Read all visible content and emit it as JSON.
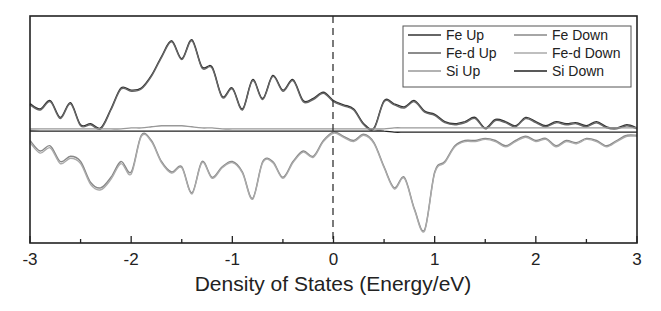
{
  "chart_data": {
    "type": "line",
    "title": "",
    "xlabel": "Density of States (Energy/eV)",
    "ylabel": "",
    "xlim": [
      -3,
      3
    ],
    "x_ticks": [
      "-3",
      "-2",
      "-1",
      "0",
      "1",
      "2",
      "3"
    ],
    "grid": false,
    "fermi_level_line": {
      "x": 0,
      "style": "dashed"
    },
    "legend": {
      "position": "upper right",
      "entries": [
        "Fe Up",
        "Fe Down",
        "Fe-d Up",
        "Fe-d Down",
        "Si Up",
        "Si Down"
      ]
    },
    "x": [
      -3.0,
      -2.9,
      -2.8,
      -2.7,
      -2.6,
      -2.5,
      -2.4,
      -2.3,
      -2.2,
      -2.1,
      -2.0,
      -1.9,
      -1.8,
      -1.7,
      -1.6,
      -1.5,
      -1.4,
      -1.3,
      -1.2,
      -1.1,
      -1.0,
      -0.9,
      -0.8,
      -0.7,
      -0.6,
      -0.5,
      -0.4,
      -0.3,
      -0.2,
      -0.1,
      0.0,
      0.1,
      0.2,
      0.3,
      0.4,
      0.5,
      0.6,
      0.7,
      0.8,
      0.9,
      1.0,
      1.1,
      1.2,
      1.3,
      1.4,
      1.5,
      1.6,
      1.7,
      1.8,
      1.9,
      2.0,
      2.1,
      2.2,
      2.3,
      2.4,
      2.5,
      2.6,
      2.7,
      2.8,
      2.9,
      3.0
    ],
    "series": [
      {
        "name": "Fe Up",
        "values": [
          0.25,
          0.2,
          0.28,
          0.12,
          0.26,
          0.05,
          0.06,
          0.02,
          0.2,
          0.4,
          0.38,
          0.4,
          0.52,
          0.7,
          0.85,
          0.68,
          0.86,
          0.6,
          0.6,
          0.32,
          0.4,
          0.2,
          0.48,
          0.3,
          0.52,
          0.38,
          0.48,
          0.28,
          0.3,
          0.36,
          0.28,
          0.24,
          0.2,
          0.06,
          0.02,
          0.28,
          0.25,
          0.22,
          0.28,
          0.18,
          0.15,
          0.08,
          0.06,
          0.08,
          0.12,
          0.02,
          0.1,
          0.08,
          0.04,
          0.12,
          0.08,
          0.04,
          0.08,
          0.06,
          0.07,
          0.04,
          0.08,
          0.03,
          0.02,
          0.05,
          0.02
        ]
      },
      {
        "name": "Fe Down",
        "values": [
          -0.1,
          -0.2,
          -0.15,
          -0.3,
          -0.25,
          -0.3,
          -0.5,
          -0.55,
          -0.45,
          -0.3,
          -0.4,
          -0.05,
          -0.1,
          -0.3,
          -0.4,
          -0.35,
          -0.6,
          -0.3,
          -0.45,
          -0.35,
          -0.3,
          -0.4,
          -0.65,
          -0.3,
          -0.3,
          -0.45,
          -0.3,
          -0.2,
          -0.25,
          -0.1,
          -0.02,
          -0.06,
          -0.1,
          -0.04,
          -0.12,
          -0.35,
          -0.55,
          -0.45,
          -0.75,
          -0.95,
          -0.4,
          -0.3,
          -0.15,
          -0.1,
          -0.1,
          -0.08,
          -0.1,
          -0.15,
          -0.1,
          -0.06,
          -0.1,
          -0.08,
          -0.15,
          -0.1,
          -0.12,
          -0.08,
          -0.1,
          -0.15,
          -0.1,
          -0.05,
          -0.05
        ]
      },
      {
        "name": "Fe-d Up",
        "values": [
          0.24,
          0.19,
          0.27,
          0.11,
          0.25,
          0.04,
          0.05,
          0.01,
          0.19,
          0.39,
          0.37,
          0.39,
          0.51,
          0.69,
          0.84,
          0.67,
          0.85,
          0.59,
          0.59,
          0.31,
          0.39,
          0.19,
          0.47,
          0.29,
          0.51,
          0.37,
          0.47,
          0.27,
          0.29,
          0.35,
          0.27,
          0.23,
          0.19,
          0.05,
          0.01,
          0.27,
          0.24,
          0.21,
          0.27,
          0.17,
          0.14,
          0.07,
          0.05,
          0.07,
          0.11,
          0.01,
          0.09,
          0.07,
          0.03,
          0.11,
          0.07,
          0.03,
          0.07,
          0.05,
          0.06,
          0.03,
          0.07,
          0.02,
          0.01,
          0.04,
          0.01
        ]
      },
      {
        "name": "Fe-d Down",
        "values": [
          -0.12,
          -0.22,
          -0.17,
          -0.32,
          -0.27,
          -0.32,
          -0.52,
          -0.57,
          -0.47,
          -0.32,
          -0.42,
          -0.06,
          -0.11,
          -0.31,
          -0.41,
          -0.36,
          -0.61,
          -0.31,
          -0.46,
          -0.36,
          -0.31,
          -0.41,
          -0.66,
          -0.31,
          -0.31,
          -0.46,
          -0.31,
          -0.21,
          -0.26,
          -0.11,
          -0.03,
          -0.07,
          -0.11,
          -0.05,
          -0.13,
          -0.36,
          -0.56,
          -0.46,
          -0.76,
          -0.96,
          -0.41,
          -0.31,
          -0.16,
          -0.11,
          -0.11,
          -0.09,
          -0.11,
          -0.16,
          -0.11,
          -0.07,
          -0.11,
          -0.09,
          -0.16,
          -0.11,
          -0.13,
          -0.09,
          -0.11,
          -0.16,
          -0.11,
          -0.06,
          -0.06
        ]
      },
      {
        "name": "Si Up",
        "values": [
          0.01,
          0.01,
          0.01,
          0.01,
          0.01,
          0.01,
          0.01,
          0.01,
          0.01,
          0.01,
          0.02,
          0.02,
          0.03,
          0.04,
          0.04,
          0.04,
          0.03,
          0.02,
          0.02,
          0.01,
          0.01,
          0.01,
          0.01,
          0.01,
          0.01,
          0.01,
          0.01,
          0.01,
          0.01,
          0.01,
          0.01,
          0.01,
          0.01,
          0.01,
          0.01,
          0.01,
          0.02,
          0.02,
          0.02,
          0.02,
          0.02,
          0.02,
          0.02,
          0.02,
          0.02,
          0.02,
          0.02,
          0.02,
          0.02,
          0.02,
          0.02,
          0.02,
          0.02,
          0.02,
          0.02,
          0.02,
          0.02,
          0.02,
          0.02,
          0.02,
          0.02
        ]
      },
      {
        "name": "Si Down",
        "values": [
          -0.01,
          -0.01,
          -0.01,
          -0.01,
          -0.01,
          -0.01,
          -0.01,
          -0.01,
          -0.01,
          -0.01,
          -0.01,
          -0.01,
          -0.01,
          -0.01,
          -0.01,
          -0.01,
          -0.01,
          -0.01,
          -0.01,
          -0.01,
          -0.01,
          -0.01,
          -0.01,
          -0.01,
          -0.01,
          -0.01,
          -0.01,
          -0.01,
          -0.01,
          -0.01,
          -0.01,
          -0.01,
          -0.01,
          -0.01,
          -0.01,
          -0.01,
          -0.02,
          -0.02,
          -0.02,
          -0.02,
          -0.02,
          -0.02,
          -0.02,
          -0.02,
          -0.02,
          -0.02,
          -0.02,
          -0.02,
          -0.02,
          -0.02,
          -0.02,
          -0.02,
          -0.02,
          -0.02,
          -0.02,
          -0.02,
          -0.02,
          -0.02,
          -0.02,
          -0.02,
          -0.02
        ]
      }
    ]
  },
  "style": {
    "Fe Up": "#333333",
    "Fe Down": "#888888",
    "Fe-d Up": "#666666",
    "Fe-d Down": "#aaaaaa",
    "Si Up": "#999999",
    "Si Down": "#222222"
  }
}
